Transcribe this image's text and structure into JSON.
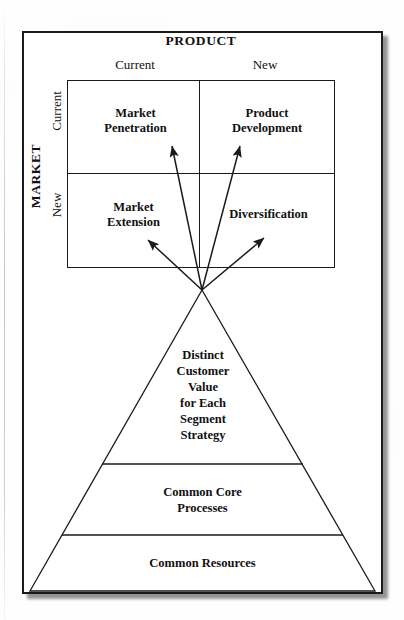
{
  "diagram": {
    "axes": {
      "product_axis_label": "PRODUCT",
      "market_axis_label": "MARKET",
      "product_columns": [
        "Current",
        "New"
      ],
      "market_rows": [
        "Current",
        "New"
      ]
    },
    "matrix_cells": [
      {
        "id": "market-penetration",
        "label": "Market\nPenetration",
        "market": "Current",
        "product": "Current"
      },
      {
        "id": "product-development",
        "label": "Product\nDevelopment",
        "market": "Current",
        "product": "New"
      },
      {
        "id": "market-extension",
        "label": "Market\nExtension",
        "market": "New",
        "product": "Current"
      },
      {
        "id": "diversification",
        "label": "Diversification",
        "market": "New",
        "product": "New"
      }
    ],
    "pyramid": {
      "tiers": [
        {
          "id": "distinct-customer-value",
          "label": "Distinct\nCustomer\nValue\nfor Each\nSegment\nStrategy",
          "position": "top"
        },
        {
          "id": "common-core-processes",
          "label": "Common Core\nProcesses",
          "position": "middle"
        },
        {
          "id": "common-resources",
          "label": "Common Resources",
          "position": "bottom"
        }
      ]
    },
    "connectors": {
      "count": 4,
      "origin_label": "pyramid-apex",
      "targets": [
        "market-penetration",
        "product-development",
        "market-extension",
        "diversification"
      ]
    },
    "colors": {
      "ink": "#1a1a1a",
      "paper": "#ffffff",
      "shadow": "rgba(0,0,0,0.42)"
    }
  }
}
